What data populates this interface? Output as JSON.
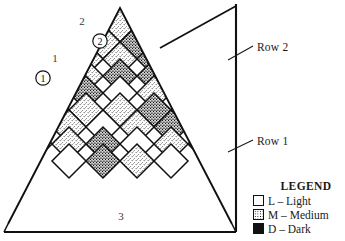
{
  "figure": {
    "kind": "quilt-block-layout-diagram"
  },
  "annotations": {
    "row2": "Row 2",
    "row1": "Row 1",
    "marker_1": "1",
    "marker_2": "2",
    "marker_3": "3",
    "circled_1": "1",
    "circled_2": "2"
  },
  "legend": {
    "title": "LEGEND",
    "items": [
      {
        "code": "L",
        "label": "L – Light",
        "swatch": "light-swatch-icon",
        "fill": "light"
      },
      {
        "code": "M",
        "label": "M – Medium",
        "swatch": "medium-swatch-icon",
        "fill": "medium"
      },
      {
        "code": "D",
        "label": "D – Dark",
        "swatch": "dark-swatch-icon",
        "fill": "dark"
      }
    ]
  },
  "colors": {
    "ink": "#1a1a1a",
    "line": "#111111",
    "paper": "#ffffff"
  },
  "chart_data": {
    "type": "heatmap",
    "title": "",
    "xlabel": "",
    "ylabel": "",
    "grid": true,
    "legend_position": "bottom-right",
    "note": "Each cell is a square rotated 45 degrees. r = lattice row index (top to bottom), c = column index (left to right). Value is the fabric value: L = Light, M = Medium, D = Dark.",
    "categories": [
      "L",
      "M",
      "D"
    ],
    "cell_size": 34,
    "rows": [
      {
        "r": 0,
        "values": [
          "L",
          "M",
          "M",
          "D",
          "L"
        ]
      },
      {
        "r": 1,
        "values": [
          "M",
          "M",
          "L",
          "M",
          "D",
          "L",
          "D",
          "M"
        ]
      },
      {
        "r": 2,
        "values": [
          "M",
          "L",
          "L",
          "M",
          "M",
          "D",
          "M",
          "D",
          "M"
        ]
      },
      {
        "r": 3,
        "values": [
          "L",
          "M",
          "M",
          "M",
          "D",
          "D",
          "M",
          "D",
          "M"
        ]
      },
      {
        "r": 4,
        "values": [
          "M",
          "L",
          "M",
          "D",
          "L",
          "M",
          "D",
          "M",
          "D"
        ]
      },
      {
        "r": 5,
        "values": [
          "M",
          "M",
          "L",
          "M",
          "M",
          "D",
          "M",
          "D",
          "M"
        ]
      },
      {
        "r": 6,
        "values": [
          "M",
          "L",
          "M",
          "L",
          "M",
          "D",
          "D",
          "M"
        ]
      },
      {
        "r": 7,
        "values": [
          "M",
          "M",
          "D",
          "L",
          "M",
          "D"
        ]
      },
      {
        "r": 8,
        "values": [
          "L",
          "D",
          "M",
          "L"
        ]
      }
    ]
  }
}
